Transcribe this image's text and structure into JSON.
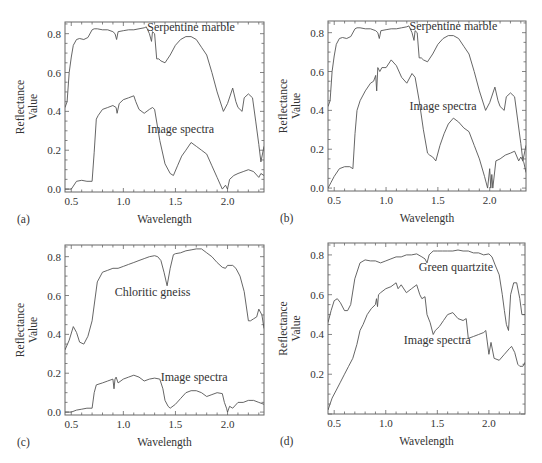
{
  "chart_data": [
    {
      "id": "a",
      "type": "line",
      "panel_label": "(a)",
      "xlabel": "Wavelength",
      "ylabel_line1": "Reflectance",
      "ylabel_line2": "Value",
      "xlim": [
        0.44,
        2.35
      ],
      "ylim": [
        -0.015,
        0.86
      ],
      "xticks": [
        0.5,
        1.0,
        1.5,
        2.0
      ],
      "xtick_labels": [
        "0.5",
        "1.0",
        "1.5",
        "2.0"
      ],
      "yticks": [
        0.0,
        0.2,
        0.4,
        0.6,
        0.8
      ],
      "ytick_labels": [
        "0.0",
        "0.2",
        "0.4",
        "0.6",
        "0.8"
      ],
      "box": {
        "x": 65,
        "y": 22,
        "w": 199,
        "h": 170
      },
      "annotations": [
        {
          "text": "Serpentine marble",
          "x": 1.65,
          "y": 0.815
        },
        {
          "text": "Image spectra",
          "x": 1.55,
          "y": 0.29
        }
      ],
      "series": [
        {
          "name": "Serpentine marble",
          "x": [
            0.44,
            0.46,
            0.48,
            0.5,
            0.52,
            0.55,
            0.58,
            0.62,
            0.66,
            0.7,
            0.72,
            0.75,
            0.8,
            0.85,
            0.9,
            0.92,
            0.935,
            0.95,
            1.0,
            1.05,
            1.1,
            1.15,
            1.2,
            1.22,
            1.25,
            1.27,
            1.28,
            1.3,
            1.32,
            1.34,
            1.36,
            1.4,
            1.45,
            1.5,
            1.55,
            1.6,
            1.65,
            1.7,
            1.75,
            1.8,
            1.85,
            1.9,
            1.96,
            2.0,
            2.05,
            2.08,
            2.1,
            2.14,
            2.16,
            2.2,
            2.24,
            2.27,
            2.3,
            2.32,
            2.35
          ],
          "y": [
            0.42,
            0.45,
            0.6,
            0.68,
            0.74,
            0.77,
            0.775,
            0.77,
            0.78,
            0.82,
            0.825,
            0.825,
            0.82,
            0.82,
            0.81,
            0.8,
            0.77,
            0.81,
            0.815,
            0.82,
            0.82,
            0.825,
            0.83,
            0.835,
            0.8,
            0.76,
            0.81,
            0.8,
            0.67,
            0.67,
            0.66,
            0.65,
            0.69,
            0.74,
            0.77,
            0.785,
            0.785,
            0.77,
            0.73,
            0.69,
            0.6,
            0.5,
            0.4,
            0.44,
            0.52,
            0.45,
            0.42,
            0.4,
            0.47,
            0.49,
            0.47,
            0.35,
            0.23,
            0.14,
            0.22
          ]
        },
        {
          "name": "Image spectra",
          "x": [
            0.44,
            0.5,
            0.55,
            0.6,
            0.65,
            0.68,
            0.7,
            0.72,
            0.74,
            0.76,
            0.8,
            0.85,
            0.9,
            0.93,
            0.94,
            0.96,
            1.0,
            1.05,
            1.1,
            1.12,
            1.15,
            1.2,
            1.25,
            1.28,
            1.3,
            1.35,
            1.4,
            1.45,
            1.48,
            1.52,
            1.56,
            1.6,
            1.65,
            1.7,
            1.75,
            1.8,
            1.85,
            1.9,
            1.95,
            1.98,
            2.0,
            2.02,
            2.06,
            2.1,
            2.15,
            2.2,
            2.25,
            2.3,
            2.32,
            2.35
          ],
          "y": [
            0.0,
            0.0,
            0.04,
            0.045,
            0.04,
            0.04,
            0.04,
            0.19,
            0.36,
            0.38,
            0.41,
            0.42,
            0.43,
            0.42,
            0.39,
            0.44,
            0.46,
            0.47,
            0.48,
            0.45,
            0.41,
            0.39,
            0.41,
            0.42,
            0.41,
            0.25,
            0.13,
            0.08,
            0.07,
            0.12,
            0.17,
            0.2,
            0.24,
            0.22,
            0.2,
            0.18,
            0.12,
            0.06,
            0.0,
            0.02,
            0.0,
            0.05,
            0.07,
            0.08,
            0.09,
            0.1,
            0.09,
            0.06,
            0.08,
            0.07
          ]
        }
      ]
    },
    {
      "id": "b",
      "type": "line",
      "panel_label": "(b)",
      "xlabel": "Wavelength",
      "ylabel_line1": "Reflectance",
      "ylabel_line2": "Value",
      "xlim": [
        0.44,
        2.35
      ],
      "ylim": [
        -0.015,
        0.86
      ],
      "xticks": [
        0.5,
        1.0,
        1.5,
        2.0
      ],
      "xtick_labels": [
        "0.5",
        "1.0",
        "1.5",
        "2.0"
      ],
      "yticks": [
        0.0,
        0.2,
        0.4,
        0.6,
        0.8
      ],
      "ytick_labels": [
        "0.0",
        "0.2",
        "0.4",
        "0.6",
        "0.8"
      ],
      "box": {
        "x": 328,
        "y": 21,
        "w": 198,
        "h": 170
      },
      "annotations": [
        {
          "text": "Serpentine marble",
          "x": 1.65,
          "y": 0.815
        },
        {
          "text": "Image spectra",
          "x": 1.55,
          "y": 0.4
        }
      ],
      "series": [
        {
          "name": "Serpentine marble",
          "x": [
            0.44,
            0.46,
            0.48,
            0.5,
            0.52,
            0.55,
            0.58,
            0.62,
            0.66,
            0.7,
            0.72,
            0.75,
            0.8,
            0.85,
            0.9,
            0.92,
            0.935,
            0.95,
            1.0,
            1.05,
            1.1,
            1.15,
            1.2,
            1.22,
            1.25,
            1.27,
            1.28,
            1.3,
            1.32,
            1.34,
            1.36,
            1.4,
            1.45,
            1.5,
            1.55,
            1.6,
            1.65,
            1.7,
            1.75,
            1.8,
            1.85,
            1.9,
            1.96,
            2.0,
            2.05,
            2.08,
            2.1,
            2.14,
            2.16,
            2.2,
            2.24,
            2.27,
            2.3,
            2.32,
            2.35
          ],
          "y": [
            0.42,
            0.45,
            0.6,
            0.68,
            0.74,
            0.77,
            0.775,
            0.77,
            0.78,
            0.82,
            0.825,
            0.825,
            0.82,
            0.82,
            0.81,
            0.8,
            0.77,
            0.81,
            0.815,
            0.82,
            0.82,
            0.825,
            0.83,
            0.835,
            0.8,
            0.76,
            0.81,
            0.8,
            0.67,
            0.67,
            0.66,
            0.65,
            0.69,
            0.74,
            0.77,
            0.785,
            0.785,
            0.77,
            0.73,
            0.69,
            0.6,
            0.5,
            0.4,
            0.44,
            0.52,
            0.45,
            0.42,
            0.4,
            0.47,
            0.49,
            0.47,
            0.35,
            0.23,
            0.14,
            0.22
          ]
        },
        {
          "name": "Image spectra",
          "x": [
            0.44,
            0.47,
            0.5,
            0.55,
            0.6,
            0.65,
            0.68,
            0.7,
            0.72,
            0.75,
            0.8,
            0.85,
            0.88,
            0.9,
            0.91,
            0.92,
            0.94,
            0.96,
            1.0,
            1.05,
            1.1,
            1.15,
            1.2,
            1.25,
            1.28,
            1.32,
            1.36,
            1.4,
            1.42,
            1.45,
            1.48,
            1.52,
            1.56,
            1.6,
            1.65,
            1.7,
            1.75,
            1.8,
            1.85,
            1.9,
            1.95,
            1.98,
            2.0,
            2.01,
            2.02,
            2.03,
            2.06,
            2.1,
            2.15,
            2.2,
            2.24,
            2.28,
            2.3,
            2.33,
            2.35
          ],
          "y": [
            0.0,
            0.03,
            0.06,
            0.1,
            0.11,
            0.11,
            0.1,
            0.28,
            0.4,
            0.45,
            0.5,
            0.54,
            0.55,
            0.58,
            0.5,
            0.62,
            0.6,
            0.62,
            0.62,
            0.66,
            0.63,
            0.57,
            0.54,
            0.59,
            0.57,
            0.45,
            0.3,
            0.18,
            0.17,
            0.16,
            0.14,
            0.22,
            0.28,
            0.33,
            0.36,
            0.34,
            0.31,
            0.29,
            0.22,
            0.15,
            0.06,
            0.0,
            0.1,
            0.0,
            0.07,
            0.0,
            0.14,
            0.15,
            0.17,
            0.18,
            0.19,
            0.14,
            0.16,
            0.13,
            0.08
          ]
        }
      ]
    },
    {
      "id": "c",
      "type": "line",
      "panel_label": "(c)",
      "xlabel": "Wavelength",
      "ylabel_line1": "Reflectance",
      "ylabel_line2": "Value",
      "xlim": [
        0.44,
        2.35
      ],
      "ylim": [
        -0.015,
        0.86
      ],
      "xticks": [
        0.5,
        1.0,
        1.5,
        2.0
      ],
      "xtick_labels": [
        "0.5",
        "1.0",
        "1.5",
        "2.0"
      ],
      "yticks": [
        0.0,
        0.2,
        0.4,
        0.6,
        0.8
      ],
      "ytick_labels": [
        "0.0",
        "0.2",
        "0.4",
        "0.6",
        "0.8"
      ],
      "box": {
        "x": 65,
        "y": 245,
        "w": 199,
        "h": 170
      },
      "annotations": [
        {
          "text": "Chloritic gneiss",
          "x": 1.28,
          "y": 0.6
        },
        {
          "text": "Image spectra",
          "x": 1.68,
          "y": 0.16
        }
      ],
      "series": [
        {
          "name": "Chloritic gneiss",
          "x": [
            0.44,
            0.48,
            0.52,
            0.55,
            0.58,
            0.62,
            0.66,
            0.7,
            0.75,
            0.8,
            0.85,
            0.9,
            0.95,
            1.0,
            1.05,
            1.1,
            1.15,
            1.2,
            1.25,
            1.3,
            1.33,
            1.36,
            1.39,
            1.42,
            1.45,
            1.48,
            1.5,
            1.55,
            1.6,
            1.65,
            1.7,
            1.75,
            1.8,
            1.85,
            1.9,
            1.95,
            1.98,
            2.0,
            2.05,
            2.08,
            2.12,
            2.16,
            2.2,
            2.22,
            2.25,
            2.28,
            2.3,
            2.33,
            2.35
          ],
          "y": [
            0.32,
            0.37,
            0.44,
            0.41,
            0.36,
            0.35,
            0.39,
            0.47,
            0.67,
            0.72,
            0.73,
            0.74,
            0.74,
            0.75,
            0.76,
            0.77,
            0.78,
            0.79,
            0.8,
            0.805,
            0.8,
            0.78,
            0.72,
            0.65,
            0.74,
            0.81,
            0.815,
            0.82,
            0.83,
            0.835,
            0.84,
            0.84,
            0.82,
            0.8,
            0.77,
            0.745,
            0.74,
            0.755,
            0.755,
            0.74,
            0.7,
            0.62,
            0.47,
            0.47,
            0.48,
            0.49,
            0.53,
            0.5,
            0.43
          ]
        },
        {
          "name": "Image spectra",
          "x": [
            0.44,
            0.5,
            0.55,
            0.6,
            0.65,
            0.68,
            0.7,
            0.72,
            0.74,
            0.8,
            0.85,
            0.9,
            0.91,
            0.92,
            0.93,
            0.95,
            1.0,
            1.05,
            1.1,
            1.15,
            1.2,
            1.25,
            1.3,
            1.35,
            1.38,
            1.4,
            1.43,
            1.45,
            1.5,
            1.55,
            1.6,
            1.65,
            1.7,
            1.75,
            1.8,
            1.85,
            1.9,
            1.95,
            1.97,
            1.99,
            2.0,
            2.02,
            2.05,
            2.1,
            2.15,
            2.2,
            2.25,
            2.3,
            2.35
          ],
          "y": [
            0.0,
            0.0,
            0.01,
            0.015,
            0.02,
            0.02,
            0.02,
            0.1,
            0.14,
            0.15,
            0.16,
            0.17,
            0.12,
            0.17,
            0.18,
            0.15,
            0.17,
            0.18,
            0.19,
            0.18,
            0.16,
            0.17,
            0.175,
            0.17,
            0.12,
            0.06,
            0.03,
            0.02,
            0.04,
            0.07,
            0.1,
            0.11,
            0.11,
            0.1,
            0.08,
            0.09,
            0.1,
            0.095,
            0.05,
            0.02,
            0.0,
            0.03,
            0.02,
            0.05,
            0.05,
            0.06,
            0.06,
            0.05,
            0.04
          ]
        }
      ]
    },
    {
      "id": "d",
      "type": "line",
      "panel_label": "(d)",
      "xlabel": "Wavelength",
      "ylabel_line1": "Reflectance",
      "ylabel_line2": "Value",
      "xlim": [
        0.44,
        2.35
      ],
      "ylim": [
        0.0,
        0.86
      ],
      "xticks": [
        0.5,
        1.0,
        1.5,
        2.0
      ],
      "xtick_labels": [
        "0.5",
        "1.0",
        "1.5",
        "2.0"
      ],
      "yticks": [
        0.2,
        0.4,
        0.6,
        0.8
      ],
      "ytick_labels": [
        "0.2",
        "0.4",
        "0.6",
        "0.8"
      ],
      "box": {
        "x": 328,
        "y": 243,
        "w": 197,
        "h": 171
      },
      "annotations": [
        {
          "text": "Green quartzite",
          "x": 1.68,
          "y": 0.72
        },
        {
          "text": "Image spectra",
          "x": 1.5,
          "y": 0.35
        }
      ],
      "series": [
        {
          "name": "Green quartzite",
          "x": [
            0.44,
            0.47,
            0.5,
            0.53,
            0.56,
            0.6,
            0.63,
            0.66,
            0.7,
            0.75,
            0.8,
            0.85,
            0.9,
            0.95,
            1.0,
            1.05,
            1.1,
            1.15,
            1.2,
            1.25,
            1.3,
            1.35,
            1.38,
            1.4,
            1.42,
            1.44,
            1.46,
            1.5,
            1.55,
            1.6,
            1.65,
            1.7,
            1.75,
            1.8,
            1.85,
            1.9,
            1.95,
            2.0,
            2.03,
            2.06,
            2.1,
            2.13,
            2.15,
            2.17,
            2.19,
            2.21,
            2.24,
            2.27,
            2.3,
            2.32,
            2.35
          ],
          "y": [
            0.46,
            0.52,
            0.57,
            0.58,
            0.56,
            0.52,
            0.52,
            0.55,
            0.68,
            0.76,
            0.775,
            0.77,
            0.77,
            0.76,
            0.77,
            0.78,
            0.79,
            0.79,
            0.8,
            0.8,
            0.805,
            0.79,
            0.78,
            0.76,
            0.8,
            0.81,
            0.82,
            0.82,
            0.82,
            0.82,
            0.82,
            0.825,
            0.82,
            0.82,
            0.81,
            0.81,
            0.8,
            0.805,
            0.79,
            0.75,
            0.7,
            0.6,
            0.52,
            0.45,
            0.42,
            0.6,
            0.66,
            0.66,
            0.58,
            0.5,
            0.5
          ]
        },
        {
          "name": "Image spectra",
          "x": [
            0.44,
            0.48,
            0.52,
            0.56,
            0.6,
            0.64,
            0.68,
            0.72,
            0.75,
            0.78,
            0.82,
            0.86,
            0.9,
            0.91,
            0.92,
            0.93,
            0.95,
            1.0,
            1.05,
            1.1,
            1.12,
            1.15,
            1.2,
            1.25,
            1.3,
            1.33,
            1.35,
            1.38,
            1.4,
            1.43,
            1.46,
            1.48,
            1.52,
            1.56,
            1.6,
            1.65,
            1.7,
            1.75,
            1.78,
            1.8,
            1.85,
            1.9,
            1.95,
            1.97,
            2.0,
            2.02,
            2.05,
            2.1,
            2.15,
            2.2,
            2.22,
            2.25,
            2.28,
            2.3,
            2.33,
            2.35
          ],
          "y": [
            0.02,
            0.08,
            0.12,
            0.16,
            0.2,
            0.24,
            0.28,
            0.35,
            0.42,
            0.45,
            0.5,
            0.53,
            0.55,
            0.58,
            0.54,
            0.6,
            0.61,
            0.63,
            0.64,
            0.66,
            0.63,
            0.65,
            0.61,
            0.63,
            0.65,
            0.6,
            0.58,
            0.59,
            0.5,
            0.46,
            0.4,
            0.42,
            0.44,
            0.47,
            0.5,
            0.51,
            0.48,
            0.47,
            0.48,
            0.38,
            0.39,
            0.4,
            0.41,
            0.42,
            0.3,
            0.36,
            0.28,
            0.27,
            0.3,
            0.33,
            0.34,
            0.31,
            0.25,
            0.24,
            0.24,
            0.26
          ]
        }
      ]
    }
  ]
}
